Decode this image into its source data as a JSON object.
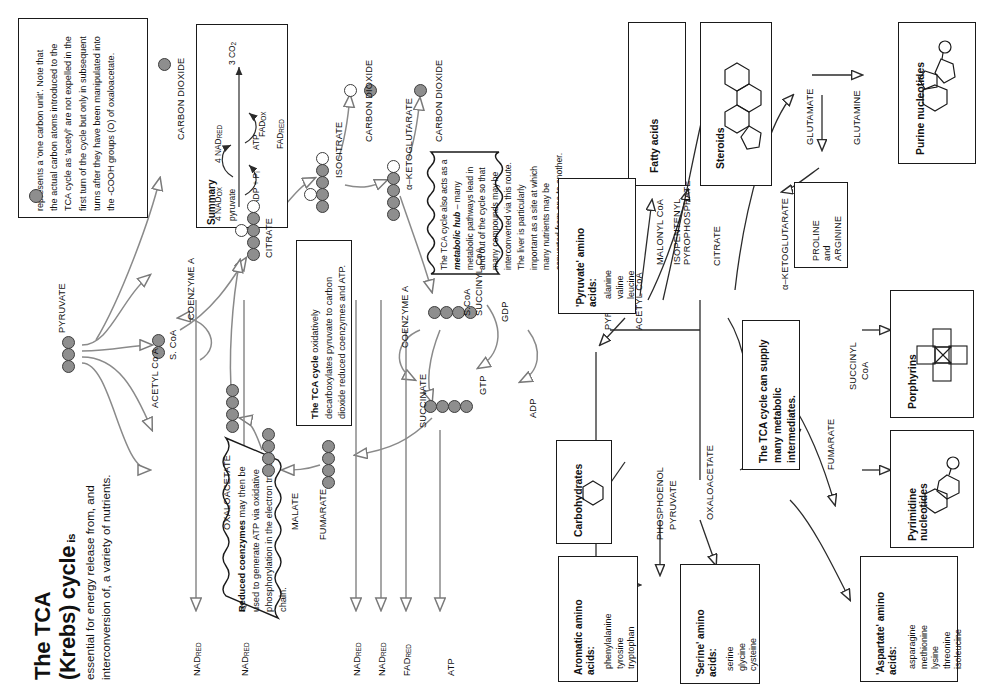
{
  "title": {
    "line1": "The TCA",
    "line2": "(Krebs) cycle",
    "line2_suffix": " is",
    "body": "essential for energy release from, and interconversion of, a variety of nutrients."
  },
  "legend_note": {
    "text": "represents a 'one carbon unit'. Note that the actual carbon atoms introduced to the TCA cycle as 'acetyl' are not expelled in the first turn of the cycle but only in subsequent turns after they have been manipulated into the -COOH groups (O) of oxaloacetate."
  },
  "summary_box": {
    "heading": "Summary",
    "substrate": "pyruvate",
    "product": "3 CO",
    "product_sub": "2",
    "in1": "ADP + P",
    "in1_sub": "i",
    "out1": "ATP",
    "in2": "4 NAD",
    "in2_sub": "OX",
    "out2": "4 NAD",
    "out2_sub": "RED",
    "in3": "FAD",
    "in3_sub": "OX",
    "out3": "FAD",
    "out3_sub": "RED"
  },
  "callouts": {
    "oxidative": {
      "bold": "The TCA cycle",
      "rest": " oxidatively decarboxylates pyruvate to carbon dioxide reduced coenzymes and ATP."
    },
    "reduced_coenzymes": {
      "bold": "Reduced coenzymes",
      "rest": " may then be used to generate ATP via oxidative phosphorylation in the electron transfer chain."
    },
    "hub": {
      "part1": "The TCA cycle also acts as a ",
      "bold": "metabolic hub",
      "part2": " – many metabolic pathways lead in and out of the cycle so that many compounds may be interconverted via this route. The liver is particularly important as a site at which many nutrients may be converted from one to another."
    },
    "intermediates": {
      "text": "The TCA cycle can supply many metabolic intermediates."
    }
  },
  "cycle_left": {
    "pyruvate": "PYRUVATE",
    "acetyl_coa": "ACETYL Co A",
    "s_coa": "S. CoA",
    "coenzyme_a_1": "COENZYME A",
    "citrate": "CITRATE",
    "isocitrate": "ISOCITRATE",
    "ketoglutarate": "α–KETOGLUTARATE",
    "succinyl_coa": "SUCCINYL CoA",
    "succinyl_s_coa": "S.CoA",
    "coenzyme_a_2": "COENZYME A",
    "succinate": "SUCCINATE",
    "fumarate": "FUMARATE",
    "malate": "MALATE",
    "oxaloacetate": "OXALOACETATE",
    "gdp": "GDP",
    "gtp": "GTP",
    "adp": "ADP",
    "atp": "ATP"
  },
  "co2_labels": [
    "CARBON DIOXIDE",
    "CARBON DIOXIDE",
    "CARBON DIOXIDE"
  ],
  "output_labels": [
    {
      "name": "NAD",
      "sub": "RED"
    },
    {
      "name": "NAD",
      "sub": "RED"
    },
    {
      "name": "NAD",
      "sub": "RED"
    },
    {
      "name": "NAD",
      "sub": "RED"
    },
    {
      "name": "FAD",
      "sub": "RED"
    },
    {
      "name": "ATP",
      "sub": ""
    }
  ],
  "cycle_right": {
    "pyruvate": "PYRUVATE",
    "acetyl_coa": "ACETYL CoA",
    "malonyl_coa": "MALONYL CoA",
    "isopentenyl": "ISOPENTENYL PYROPHOSPHATE",
    "citrate": "CITRATE",
    "ketoglutarate": "α–KETOGLUTARATE",
    "glutamate": "GLUTAMATE",
    "glutamine": "GLUTAMINE",
    "succinyl_coa_1": "SUCCINYL",
    "succinyl_coa_2": "CoA",
    "fumarate": "FUMARATE",
    "oxaloacetate": "OXALOACETATE",
    "aspartate": "ASPARTATE",
    "pep_1": "PHOSPHOENOL",
    "pep_2": "PYRUVATE"
  },
  "product_boxes": [
    {
      "name": "fatty-acids",
      "label": "Fatty acids"
    },
    {
      "name": "steroids",
      "label": "Steroids"
    },
    {
      "name": "purine-nucleotides",
      "label": "Purine nucleotides"
    },
    {
      "name": "porphyrins",
      "label": "Porphyrins"
    },
    {
      "name": "pyrimidine-nucleotides",
      "label": "Pyrimidine nucleotides"
    },
    {
      "name": "carbohydrates",
      "label": "Carbohydrates"
    }
  ],
  "proline_arginine": {
    "l1": "PROLINE",
    "l2": "and",
    "l3": "ARGININE"
  },
  "amino_acid_boxes": [
    {
      "name": "pyruvate-amino-acids",
      "heading1": "'Pyruvate' amino",
      "heading2": "acids:",
      "members": [
        "alanine",
        "valine",
        "leucine"
      ]
    },
    {
      "name": "aromatic-amino-acids",
      "heading1": "Aromatic amino",
      "heading2": "acids:",
      "members": [
        "phenylalanine",
        "tyrosine",
        "tryptophan"
      ]
    },
    {
      "name": "serine-amino-acids",
      "heading1": "'Serine' amino",
      "heading2": "acids:",
      "members": [
        "serine",
        "glycine",
        "cysteine"
      ]
    },
    {
      "name": "aspartate-amino-acids",
      "heading1": "'Aspartate' amino",
      "heading2": "acids:",
      "members": [
        "asparagine",
        "methionine",
        "lysine",
        "threonine",
        "isoleucine"
      ]
    }
  ],
  "colors": {
    "carbon_gray": "#8e8e8e",
    "outline": "#3d3d3d",
    "border": "#1a1a1a"
  }
}
